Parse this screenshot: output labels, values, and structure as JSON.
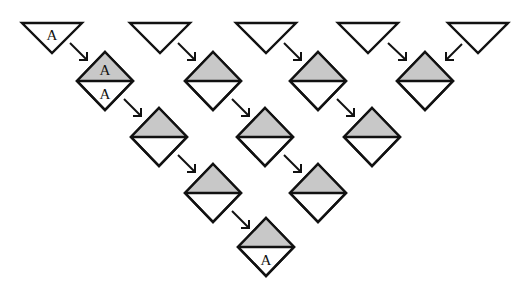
{
  "diagram": {
    "type": "triangular-cascade",
    "colors": {
      "stroke": "#111111",
      "shade": "#c8c8c8",
      "background": "#ffffff"
    },
    "geometry": {
      "triangle_half_width": 30,
      "triangle_height": 30,
      "diamond_half_width": 28,
      "diamond_half_height": 29
    },
    "triangles": [
      {
        "id": "t0",
        "cx": 52,
        "top": 23,
        "label": "A"
      },
      {
        "id": "t1",
        "cx": 160,
        "top": 23,
        "label": ""
      },
      {
        "id": "t2",
        "cx": 266,
        "top": 23,
        "label": ""
      },
      {
        "id": "t3",
        "cx": 368,
        "top": 23,
        "label": ""
      },
      {
        "id": "t4",
        "cx": 478,
        "top": 23,
        "label": ""
      }
    ],
    "diamonds": [
      {
        "id": "d1a",
        "row": 1,
        "cx": 105,
        "cy": 81,
        "top_label": "A",
        "bottom_label": "A"
      },
      {
        "id": "d1b",
        "row": 1,
        "cx": 213,
        "cy": 81,
        "top_label": "",
        "bottom_label": ""
      },
      {
        "id": "d1c",
        "row": 1,
        "cx": 318,
        "cy": 81,
        "top_label": "",
        "bottom_label": ""
      },
      {
        "id": "d1d",
        "row": 1,
        "cx": 425,
        "cy": 81,
        "top_label": "",
        "bottom_label": ""
      },
      {
        "id": "d2a",
        "row": 2,
        "cx": 159,
        "cy": 137,
        "top_label": "",
        "bottom_label": ""
      },
      {
        "id": "d2b",
        "row": 2,
        "cx": 265,
        "cy": 137,
        "top_label": "",
        "bottom_label": ""
      },
      {
        "id": "d2c",
        "row": 2,
        "cx": 372,
        "cy": 137,
        "top_label": "",
        "bottom_label": ""
      },
      {
        "id": "d3a",
        "row": 3,
        "cx": 213,
        "cy": 193,
        "top_label": "",
        "bottom_label": ""
      },
      {
        "id": "d3b",
        "row": 3,
        "cx": 318,
        "cy": 193,
        "top_label": "",
        "bottom_label": ""
      },
      {
        "id": "d4a",
        "row": 4,
        "cx": 266,
        "cy": 247,
        "top_label": "",
        "bottom_label": "A"
      }
    ],
    "arrows": [
      {
        "from": "t0",
        "to": "d1a",
        "x1": 70,
        "y1": 43,
        "x2": 87,
        "y2": 60,
        "dir": "down-right"
      },
      {
        "from": "t1",
        "to": "d1b",
        "x1": 178,
        "y1": 43,
        "x2": 195,
        "y2": 60,
        "dir": "down-right"
      },
      {
        "from": "t2",
        "to": "d1c",
        "x1": 284,
        "y1": 43,
        "x2": 301,
        "y2": 60,
        "dir": "down-right"
      },
      {
        "from": "t3",
        "to": "d1d",
        "x1": 388,
        "y1": 43,
        "x2": 406,
        "y2": 60,
        "dir": "down-right"
      },
      {
        "from": "t4",
        "to": "d1d",
        "x1": 462,
        "y1": 44,
        "x2": 446,
        "y2": 60,
        "dir": "down-left"
      },
      {
        "from": "d1a",
        "to": "d2a",
        "x1": 124,
        "y1": 99,
        "x2": 141,
        "y2": 116,
        "dir": "down-right"
      },
      {
        "from": "d1b",
        "to": "d2b",
        "x1": 232,
        "y1": 99,
        "x2": 249,
        "y2": 116,
        "dir": "down-right"
      },
      {
        "from": "d1c",
        "to": "d2c",
        "x1": 337,
        "y1": 99,
        "x2": 354,
        "y2": 116,
        "dir": "down-right"
      },
      {
        "from": "d2a",
        "to": "d3a",
        "x1": 178,
        "y1": 155,
        "x2": 195,
        "y2": 172,
        "dir": "down-right"
      },
      {
        "from": "d2b",
        "to": "d3b",
        "x1": 284,
        "y1": 155,
        "x2": 301,
        "y2": 172,
        "dir": "down-right"
      },
      {
        "from": "d3a",
        "to": "d4a",
        "x1": 232,
        "y1": 211,
        "x2": 249,
        "y2": 228,
        "dir": "down-right"
      }
    ]
  }
}
